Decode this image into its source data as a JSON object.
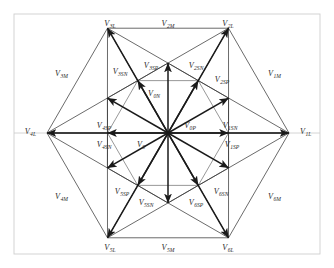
{
  "figure": {
    "geometry": {
      "center_x": 168,
      "center_y": 133,
      "r_large": 121,
      "r_medium": 105,
      "r_small": 60.5,
      "frame": {
        "x": 14,
        "y": 14,
        "width": 306,
        "height": 240
      }
    },
    "colors": {
      "vector_stroke": "#1a1a1a",
      "hex_stroke": "#3a3a3a",
      "frame_stroke": "#cfcfcf",
      "axis_stroke": "#c9c9c9",
      "label_fill": "#2a2a2a",
      "background": "#ffffff"
    }
  },
  "chart_data": {
    "type": "scatter",
    "xlabel": "",
    "ylabel": "",
    "vectors": [
      {
        "name": "V1L",
        "label": "V",
        "sub": "1L",
        "angle_deg": 0,
        "magnitude": "large",
        "lx": 300,
        "ly": 134,
        "anchor": "start"
      },
      {
        "name": "V2L",
        "label": "V",
        "sub": "2L",
        "angle_deg": 60,
        "magnitude": "large",
        "lx": 228,
        "ly": 26,
        "anchor": "middle"
      },
      {
        "name": "V3L",
        "label": "V",
        "sub": "3L",
        "angle_deg": 120,
        "magnitude": "large",
        "lx": 110,
        "ly": 26,
        "anchor": "middle"
      },
      {
        "name": "V4L",
        "label": "V",
        "sub": "4L",
        "angle_deg": 180,
        "magnitude": "large",
        "lx": 36,
        "ly": 134,
        "anchor": "end"
      },
      {
        "name": "V5L",
        "label": "V",
        "sub": "5L",
        "angle_deg": 240,
        "magnitude": "large",
        "lx": 110,
        "ly": 250,
        "anchor": "middle"
      },
      {
        "name": "V6L",
        "label": "V",
        "sub": "6L",
        "angle_deg": 300,
        "magnitude": "large",
        "lx": 228,
        "ly": 250,
        "anchor": "middle"
      },
      {
        "name": "V1M",
        "label": "V",
        "sub": "1M",
        "angle_deg": 30,
        "magnitude": "medium",
        "lx": 268,
        "ly": 76,
        "anchor": "start"
      },
      {
        "name": "V2M",
        "label": "V",
        "sub": "2M",
        "angle_deg": 90,
        "magnitude": "medium",
        "lx": 168,
        "ly": 26,
        "anchor": "middle"
      },
      {
        "name": "V3M",
        "label": "V",
        "sub": "3M",
        "angle_deg": 150,
        "magnitude": "medium",
        "lx": 68,
        "ly": 76,
        "anchor": "end"
      },
      {
        "name": "V4M",
        "label": "V",
        "sub": "4M",
        "angle_deg": 210,
        "magnitude": "medium",
        "lx": 68,
        "ly": 199,
        "anchor": "end"
      },
      {
        "name": "V5M",
        "label": "V",
        "sub": "5M",
        "angle_deg": 270,
        "magnitude": "medium",
        "lx": 168,
        "ly": 250,
        "anchor": "middle"
      },
      {
        "name": "V6M",
        "label": "V",
        "sub": "6M",
        "angle_deg": 330,
        "magnitude": "medium",
        "lx": 268,
        "ly": 199,
        "anchor": "start"
      },
      {
        "name": "V1SN",
        "label": "V",
        "sub": "1SN",
        "angle_deg": 0,
        "magnitude": "small",
        "lx": 230,
        "ly": 128,
        "anchor": "middle"
      },
      {
        "name": "V1SP",
        "label": "V",
        "sub": "1SP",
        "angle_deg": 0,
        "magnitude": "small",
        "lx": 232,
        "ly": 147,
        "anchor": "middle"
      },
      {
        "name": "V2SN",
        "label": "V",
        "sub": "2SN",
        "angle_deg": 60,
        "magnitude": "small",
        "lx": 196,
        "ly": 68,
        "anchor": "middle"
      },
      {
        "name": "V2SP",
        "label": "V",
        "sub": "2SP",
        "angle_deg": 60,
        "magnitude": "small",
        "lx": 222,
        "ly": 82,
        "anchor": "middle"
      },
      {
        "name": "V3SN",
        "label": "V",
        "sub": "3SN",
        "angle_deg": 120,
        "magnitude": "small",
        "lx": 120,
        "ly": 74,
        "anchor": "middle"
      },
      {
        "name": "V3SP",
        "label": "V",
        "sub": "3SP",
        "angle_deg": 120,
        "magnitude": "small",
        "lx": 151,
        "ly": 68,
        "anchor": "middle"
      },
      {
        "name": "V4SP",
        "label": "V",
        "sub": "4SP",
        "angle_deg": 180,
        "magnitude": "small",
        "lx": 104,
        "ly": 128,
        "anchor": "middle"
      },
      {
        "name": "V4SN",
        "label": "V",
        "sub": "4SN",
        "angle_deg": 180,
        "magnitude": "small",
        "lx": 104,
        "ly": 147,
        "anchor": "middle"
      },
      {
        "name": "V5SP",
        "label": "V",
        "sub": "5SP",
        "angle_deg": 240,
        "magnitude": "small",
        "lx": 122,
        "ly": 194,
        "anchor": "middle"
      },
      {
        "name": "V5SN",
        "label": "V",
        "sub": "5SN",
        "angle_deg": 240,
        "magnitude": "small",
        "lx": 146,
        "ly": 205,
        "anchor": "middle"
      },
      {
        "name": "V6SP",
        "label": "V",
        "sub": "6SP",
        "angle_deg": 300,
        "magnitude": "small",
        "lx": 196,
        "ly": 205,
        "anchor": "middle"
      },
      {
        "name": "V6SN",
        "label": "V",
        "sub": "6SN",
        "angle_deg": 300,
        "magnitude": "small",
        "lx": 221,
        "ly": 194,
        "anchor": "middle"
      },
      {
        "name": "V0",
        "label": "V",
        "sub": "0",
        "angle_deg": null,
        "magnitude": "zero",
        "lx": 141,
        "ly": 147,
        "anchor": "middle"
      },
      {
        "name": "V0P",
        "label": "V",
        "sub": "0P",
        "angle_deg": null,
        "magnitude": "zero",
        "lx": 190,
        "ly": 128,
        "anchor": "middle"
      },
      {
        "name": "V0N",
        "label": "V",
        "sub": "0N",
        "angle_deg": null,
        "magnitude": "zero",
        "lx": 154,
        "ly": 96,
        "anchor": "middle"
      }
    ]
  }
}
